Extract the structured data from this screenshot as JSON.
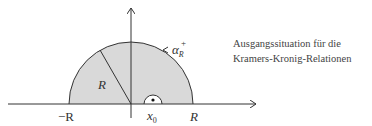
{
  "diagram": {
    "labels": {
      "neg_R": "−R",
      "pos_R": "R",
      "radius": "R",
      "x0_main": "x",
      "x0_sub": "0",
      "arc_main": "α",
      "arc_sub": "R",
      "arc_sup": "+"
    },
    "colors": {
      "fill": "#d9d9d9",
      "stroke": "#333333",
      "text": "#444444"
    }
  },
  "caption": {
    "line1": "Ausgangssituation für die",
    "line2": "Kramers-Kronig-Relationen"
  }
}
